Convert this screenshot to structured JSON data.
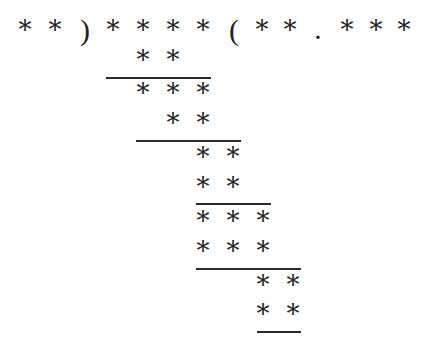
{
  "puzzle": {
    "title": "",
    "glyphs": {
      "star": "*",
      "open_paren": ")",
      "close_paren": "(",
      "dot": "."
    },
    "divisor": "**",
    "dividend": "****",
    "quotient": "**.***",
    "rows": [
      {
        "y": 30,
        "cells": [
          {
            "x": 25,
            "t": "*"
          },
          {
            "x": 55,
            "t": "*"
          },
          {
            "x": 85,
            "t": ")"
          },
          {
            "x": 113,
            "t": "*"
          },
          {
            "x": 143,
            "t": "*"
          },
          {
            "x": 173,
            "t": "*"
          },
          {
            "x": 203,
            "t": "*"
          },
          {
            "x": 234,
            "t": "("
          },
          {
            "x": 262,
            "t": "*"
          },
          {
            "x": 290,
            "t": "*"
          },
          {
            "x": 318,
            "t": "."
          },
          {
            "x": 347,
            "t": "*"
          },
          {
            "x": 376,
            "t": "*"
          },
          {
            "x": 404,
            "t": "*"
          }
        ]
      },
      {
        "y": 60,
        "cells": [
          {
            "x": 143,
            "t": "*"
          },
          {
            "x": 173,
            "t": "*"
          }
        ]
      },
      {
        "y": 93,
        "cells": [
          {
            "x": 143,
            "t": "*"
          },
          {
            "x": 173,
            "t": "*"
          },
          {
            "x": 203,
            "t": "*"
          }
        ]
      },
      {
        "y": 123,
        "cells": [
          {
            "x": 173,
            "t": "*"
          },
          {
            "x": 203,
            "t": "*"
          }
        ]
      },
      {
        "y": 157,
        "cells": [
          {
            "x": 203,
            "t": "*"
          },
          {
            "x": 233,
            "t": "*"
          }
        ]
      },
      {
        "y": 187,
        "cells": [
          {
            "x": 203,
            "t": "*"
          },
          {
            "x": 233,
            "t": "*"
          }
        ]
      },
      {
        "y": 221,
        "cells": [
          {
            "x": 203,
            "t": "*"
          },
          {
            "x": 233,
            "t": "*"
          },
          {
            "x": 263,
            "t": "*"
          }
        ]
      },
      {
        "y": 251,
        "cells": [
          {
            "x": 203,
            "t": "*"
          },
          {
            "x": 233,
            "t": "*"
          },
          {
            "x": 263,
            "t": "*"
          }
        ]
      },
      {
        "y": 285,
        "cells": [
          {
            "x": 263,
            "t": "*"
          },
          {
            "x": 293,
            "t": "*"
          }
        ]
      },
      {
        "y": 314,
        "cells": [
          {
            "x": 263,
            "t": "*"
          },
          {
            "x": 293,
            "t": "*"
          }
        ]
      }
    ],
    "rules": [
      {
        "x1": 106,
        "x2": 211,
        "y": 77
      },
      {
        "x1": 136,
        "x2": 241,
        "y": 140
      },
      {
        "x1": 196,
        "x2": 271,
        "y": 203
      },
      {
        "x1": 196,
        "x2": 301,
        "y": 268
      },
      {
        "x1": 257,
        "x2": 301,
        "y": 331
      }
    ]
  }
}
